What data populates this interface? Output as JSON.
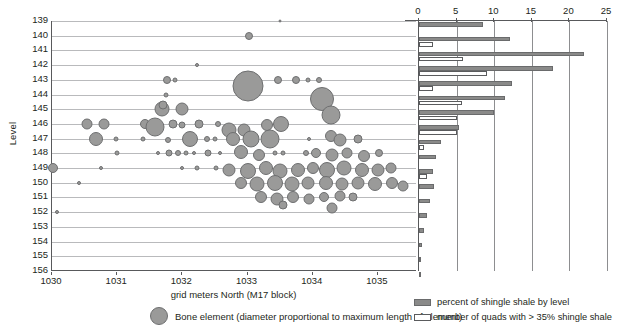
{
  "chart_data": {
    "type": "scatter",
    "title": "",
    "xlabel": "grid meters North (M17 block)",
    "ylabel": "Level",
    "xlim": [
      1030,
      1035.6
    ],
    "ylim": [
      139,
      156
    ],
    "xticks": [
      1030,
      1031,
      1032,
      1033,
      1034,
      1035
    ],
    "yticks": [
      139,
      140,
      141,
      142,
      143,
      144,
      145,
      146,
      147,
      148,
      149,
      150,
      151,
      152,
      153,
      154,
      155,
      156
    ],
    "grid": true,
    "legend_position": "bottom",
    "series": [
      {
        "name": "Bone element (diameter proportional to maximum length of element)",
        "type": "bubble",
        "marker_color": "#9a9a99",
        "points": [
          {
            "x": 1033.5,
            "y": 139.0,
            "d": 3
          },
          {
            "x": 1033.03,
            "y": 140.0,
            "d": 8
          },
          {
            "x": 1032.22,
            "y": 142.0,
            "d": 4
          },
          {
            "x": 1031.77,
            "y": 143.0,
            "d": 8
          },
          {
            "x": 1031.88,
            "y": 143.0,
            "d": 5
          },
          {
            "x": 1033.0,
            "y": 143.4,
            "d": 31
          },
          {
            "x": 1033.46,
            "y": 143.0,
            "d": 8
          },
          {
            "x": 1033.75,
            "y": 143.0,
            "d": 8
          },
          {
            "x": 1033.92,
            "y": 143.0,
            "d": 5
          },
          {
            "x": 1034.1,
            "y": 143.0,
            "d": 6
          },
          {
            "x": 1031.75,
            "y": 144.0,
            "d": 5
          },
          {
            "x": 1034.15,
            "y": 144.3,
            "d": 24
          },
          {
            "x": 1031.68,
            "y": 145.0,
            "d": 15
          },
          {
            "x": 1031.7,
            "y": 144.7,
            "d": 9
          },
          {
            "x": 1032.0,
            "y": 145.0,
            "d": 13
          },
          {
            "x": 1034.28,
            "y": 145.4,
            "d": 19
          },
          {
            "x": 1030.53,
            "y": 146.0,
            "d": 11
          },
          {
            "x": 1030.8,
            "y": 146.0,
            "d": 11
          },
          {
            "x": 1031.42,
            "y": 146.0,
            "d": 10
          },
          {
            "x": 1031.58,
            "y": 146.2,
            "d": 19
          },
          {
            "x": 1031.85,
            "y": 146.0,
            "d": 9
          },
          {
            "x": 1032.0,
            "y": 146.1,
            "d": 7
          },
          {
            "x": 1032.25,
            "y": 146.0,
            "d": 9
          },
          {
            "x": 1032.55,
            "y": 146.0,
            "d": 6
          },
          {
            "x": 1032.72,
            "y": 146.4,
            "d": 15
          },
          {
            "x": 1032.95,
            "y": 146.4,
            "d": 13
          },
          {
            "x": 1033.3,
            "y": 146.1,
            "d": 12
          },
          {
            "x": 1033.52,
            "y": 146.0,
            "d": 16
          },
          {
            "x": 1030.68,
            "y": 147.0,
            "d": 14
          },
          {
            "x": 1030.98,
            "y": 147.0,
            "d": 5
          },
          {
            "x": 1031.4,
            "y": 147.0,
            "d": 5
          },
          {
            "x": 1031.78,
            "y": 147.1,
            "d": 6
          },
          {
            "x": 1032.12,
            "y": 147.0,
            "d": 16
          },
          {
            "x": 1032.38,
            "y": 147.0,
            "d": 6
          },
          {
            "x": 1032.5,
            "y": 147.0,
            "d": 5
          },
          {
            "x": 1032.78,
            "y": 147.0,
            "d": 14
          },
          {
            "x": 1033.05,
            "y": 147.0,
            "d": 17
          },
          {
            "x": 1033.35,
            "y": 147.0,
            "d": 19
          },
          {
            "x": 1033.95,
            "y": 147.0,
            "d": 4
          },
          {
            "x": 1034.28,
            "y": 146.8,
            "d": 12
          },
          {
            "x": 1034.42,
            "y": 147.1,
            "d": 13
          },
          {
            "x": 1034.7,
            "y": 147.0,
            "d": 9
          },
          {
            "x": 1031.0,
            "y": 148.0,
            "d": 5
          },
          {
            "x": 1031.62,
            "y": 148.0,
            "d": 4
          },
          {
            "x": 1031.8,
            "y": 148.0,
            "d": 7
          },
          {
            "x": 1031.94,
            "y": 148.0,
            "d": 6
          },
          {
            "x": 1032.06,
            "y": 148.0,
            "d": 5
          },
          {
            "x": 1032.18,
            "y": 148.0,
            "d": 4
          },
          {
            "x": 1032.4,
            "y": 148.0,
            "d": 7
          },
          {
            "x": 1032.58,
            "y": 148.0,
            "d": 4
          },
          {
            "x": 1032.9,
            "y": 147.9,
            "d": 14
          },
          {
            "x": 1033.18,
            "y": 148.1,
            "d": 12
          },
          {
            "x": 1033.42,
            "y": 148.0,
            "d": 5
          },
          {
            "x": 1033.55,
            "y": 148.0,
            "d": 5
          },
          {
            "x": 1033.9,
            "y": 148.0,
            "d": 6
          },
          {
            "x": 1034.05,
            "y": 148.0,
            "d": 10
          },
          {
            "x": 1034.3,
            "y": 148.1,
            "d": 13
          },
          {
            "x": 1034.52,
            "y": 148.0,
            "d": 11
          },
          {
            "x": 1034.78,
            "y": 148.2,
            "d": 12
          },
          {
            "x": 1035.02,
            "y": 148.0,
            "d": 8
          },
          {
            "x": 1030.02,
            "y": 149.0,
            "d": 10
          },
          {
            "x": 1030.75,
            "y": 149.0,
            "d": 4
          },
          {
            "x": 1032.0,
            "y": 149.0,
            "d": 4
          },
          {
            "x": 1032.22,
            "y": 149.0,
            "d": 5
          },
          {
            "x": 1032.52,
            "y": 149.0,
            "d": 5
          },
          {
            "x": 1032.72,
            "y": 149.1,
            "d": 13
          },
          {
            "x": 1033.0,
            "y": 149.2,
            "d": 16
          },
          {
            "x": 1033.28,
            "y": 149.0,
            "d": 14
          },
          {
            "x": 1033.5,
            "y": 149.2,
            "d": 15
          },
          {
            "x": 1033.78,
            "y": 149.1,
            "d": 14
          },
          {
            "x": 1034.0,
            "y": 149.0,
            "d": 12
          },
          {
            "x": 1034.22,
            "y": 149.1,
            "d": 16
          },
          {
            "x": 1034.48,
            "y": 149.0,
            "d": 15
          },
          {
            "x": 1034.75,
            "y": 149.1,
            "d": 14
          },
          {
            "x": 1035.0,
            "y": 149.1,
            "d": 13
          },
          {
            "x": 1035.2,
            "y": 149.0,
            "d": 11
          },
          {
            "x": 1030.42,
            "y": 150.0,
            "d": 4
          },
          {
            "x": 1032.9,
            "y": 150.0,
            "d": 12
          },
          {
            "x": 1033.15,
            "y": 150.1,
            "d": 15
          },
          {
            "x": 1033.42,
            "y": 150.0,
            "d": 16
          },
          {
            "x": 1033.68,
            "y": 150.1,
            "d": 15
          },
          {
            "x": 1033.92,
            "y": 150.0,
            "d": 13
          },
          {
            "x": 1034.2,
            "y": 150.0,
            "d": 14
          },
          {
            "x": 1034.45,
            "y": 150.1,
            "d": 13
          },
          {
            "x": 1034.7,
            "y": 150.0,
            "d": 13
          },
          {
            "x": 1034.95,
            "y": 150.1,
            "d": 14
          },
          {
            "x": 1035.22,
            "y": 150.0,
            "d": 12
          },
          {
            "x": 1035.38,
            "y": 150.2,
            "d": 11
          },
          {
            "x": 1033.2,
            "y": 151.0,
            "d": 12
          },
          {
            "x": 1033.45,
            "y": 151.1,
            "d": 13
          },
          {
            "x": 1033.7,
            "y": 151.0,
            "d": 12
          },
          {
            "x": 1033.95,
            "y": 151.1,
            "d": 11
          },
          {
            "x": 1034.18,
            "y": 151.0,
            "d": 10
          },
          {
            "x": 1034.42,
            "y": 150.9,
            "d": 11
          },
          {
            "x": 1034.62,
            "y": 151.0,
            "d": 9
          },
          {
            "x": 1033.55,
            "y": 151.5,
            "d": 9
          },
          {
            "x": 1034.3,
            "y": 151.7,
            "d": 11
          },
          {
            "x": 1030.08,
            "y": 152.0,
            "d": 4
          }
        ]
      }
    ],
    "bar_panel": {
      "type": "bar",
      "orientation": "horizontal",
      "xlim": [
        0,
        25
      ],
      "xticks": [
        0,
        5,
        10,
        15,
        20,
        25
      ],
      "axis_position": "top",
      "grid": true,
      "levels": [
        139,
        140,
        141,
        142,
        143,
        144,
        145,
        146,
        147,
        148,
        149,
        150,
        151,
        152,
        153,
        154,
        155,
        156
      ],
      "series": [
        {
          "name": "percent of shingle shale by level",
          "color": "#8a8a89",
          "values": [
            8.5,
            12.1,
            22.0,
            17.8,
            12.4,
            11.5,
            10.0,
            5.3,
            2.9,
            2.2,
            1.9,
            2.0,
            1.5,
            1.1,
            0.6,
            0.4,
            0.3,
            0.3
          ]
        },
        {
          "name": "number of quads with > 35% shingle shale",
          "color": "#ffffff",
          "values": [
            0,
            1.8,
            5.8,
            9.0,
            1.9,
            5.7,
            5.0,
            5.0,
            0.7,
            0.0,
            1.0,
            0.0,
            0.0,
            0.0,
            0.0,
            0.0,
            0.0,
            0.0
          ]
        }
      ]
    }
  },
  "legend": {
    "bubble_label": "Bone element (diameter proportional to maximum length of element)",
    "bar_items": [
      {
        "label": "percent of shingle shale by level",
        "style": "filled"
      },
      {
        "label": "number of quads with > 35% shingle shale",
        "style": "outline"
      }
    ]
  }
}
